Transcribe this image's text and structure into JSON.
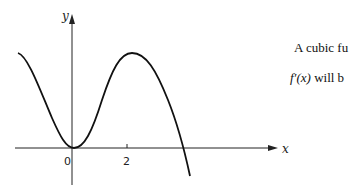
{
  "diagram": {
    "axes": {
      "x_label": "x",
      "y_label": "y"
    },
    "ticks": {
      "origin": "0",
      "x_tick": "2"
    },
    "curve": "cubic-like graph with local minimum at origin, local maximum near x=2, crossing x-axis after maximum"
  },
  "text": {
    "line1": "A cubic fu",
    "line2_fn": "f′(x)",
    "line2_rest": " will b"
  }
}
